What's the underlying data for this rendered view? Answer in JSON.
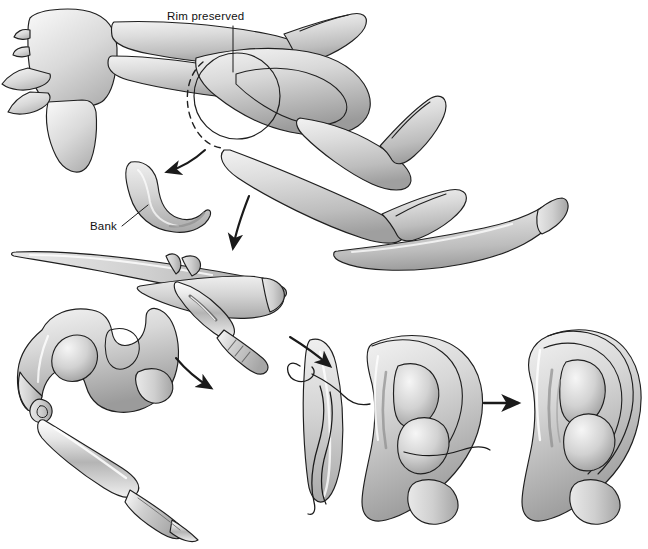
{
  "figure": {
    "domain": "medical-illustration",
    "background_color": "#ffffff",
    "line_color": "#1a1a1a",
    "cartilage_fill_light": "#ececec",
    "cartilage_fill_mid": "#c9c9c9",
    "cartilage_fill_dark": "#9a9a9a",
    "shadow_color": "#8d8d8d",
    "metal_light": "#f2f2f2",
    "metal_dark": "#a8a8a8"
  },
  "labels": {
    "rim_preserved": "Rim preserved",
    "bank": "Bank"
  },
  "panels": [
    {
      "id": "panel-donor-site",
      "name": "costal-cartilage-donor-site",
      "caption_labels": [
        "Rim preserved",
        "Bank"
      ],
      "elements": [
        "sternum",
        "costal-cartilage-ribs",
        "harvest-outline-solid",
        "harvest-outline-dashed",
        "synchondrosis-block",
        "floating-rib-strip"
      ]
    },
    {
      "id": "panel-bank-graft",
      "name": "banked-cartilage-crescent",
      "elements": [
        "crescent-cartilage-graft"
      ]
    },
    {
      "id": "panel-helix-carving",
      "name": "helix-rim-carving-with-scalpel",
      "elements": [
        "helix-rim-strip",
        "floating-rib-blank",
        "scalpel-blade",
        "scalpel-handle"
      ]
    },
    {
      "id": "panel-base-block-carving",
      "name": "base-block-carving-with-instrument",
      "elements": [
        "base-framework-block",
        "antihelix-crus",
        "carving-gouge",
        "gouge-handle"
      ]
    },
    {
      "id": "panel-assembly",
      "name": "framework-assembly-with-sutures",
      "elements": [
        "base-framework",
        "helix-rim-strip",
        "suture-loop",
        "suture-tails"
      ]
    },
    {
      "id": "panel-final",
      "name": "completed-auricular-framework",
      "elements": [
        "completed-framework"
      ]
    }
  ],
  "arrows": [
    {
      "id": "arrow-harvest-to-bank",
      "name": "arrow-harvest-to-bank",
      "style": "curved",
      "direction": "down-left"
    },
    {
      "id": "arrow-donor-to-carving",
      "name": "arrow-donor-to-carving",
      "style": "curved",
      "direction": "down"
    },
    {
      "id": "arrow-carving-to-base",
      "name": "arrow-carving-to-base",
      "style": "curved",
      "direction": "down-left"
    },
    {
      "id": "arrow-base-to-assembly",
      "name": "arrow-base-to-assembly",
      "style": "curved",
      "direction": "down-right"
    },
    {
      "id": "arrow-assembly-to-final",
      "name": "arrow-assembly-to-final",
      "style": "straight",
      "direction": "right"
    }
  ]
}
